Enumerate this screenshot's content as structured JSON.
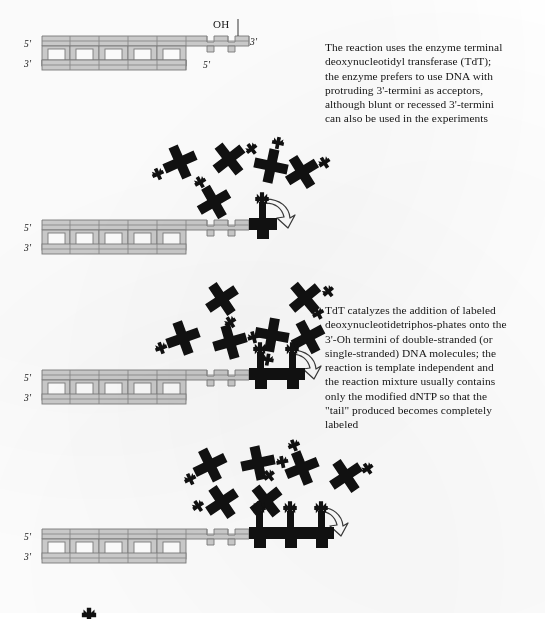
{
  "figure": {
    "background_color": "#ffffff",
    "duplex_color": "#cdcdcd",
    "duplex_outline_color": "#7c7c7c",
    "labeled_nucleotide_color": "#111111",
    "arrow_outline_color": "#3a3a3a"
  },
  "panels": [
    {
      "id": "panel-1",
      "step": 1,
      "description": "Double-stranded DNA with protruding 3'-terminus bearing a free OH group",
      "labels": {
        "top_left": "5'",
        "bottom_left": "3'",
        "top_right": "3'",
        "bottom_right": "5'",
        "hydroxyl": "OH"
      },
      "base_pairs": 5,
      "overhang_units": 3,
      "incorporated_nucleotides": 0,
      "free_nucleotides": 0,
      "has_arrow": false
    },
    {
      "id": "panel-2",
      "step": 2,
      "description": "Labeled dNTPs in solution; first modified nucleotide added to the 3'-OH terminus",
      "labels": {
        "top_left": "5'",
        "bottom_left": "3'"
      },
      "base_pairs": 5,
      "overhang_units": 3,
      "incorporated_nucleotides": 1,
      "free_nucleotides": 5,
      "has_arrow": true
    },
    {
      "id": "panel-3",
      "step": 3,
      "description": "Chain elongation continues; two labeled nucleotides now incorporated into the tail",
      "labels": {
        "top_left": "5'",
        "bottom_left": "3'"
      },
      "base_pairs": 5,
      "overhang_units": 3,
      "incorporated_nucleotides": 2,
      "free_nucleotides": 7,
      "has_arrow": true
    },
    {
      "id": "panel-4",
      "step": 4,
      "description": "Completely labeled tail with three incorporated modified nucleotides",
      "labels": {
        "top_left": "5'",
        "bottom_left": "3'"
      },
      "base_pairs": 5,
      "overhang_units": 3,
      "incorporated_nucleotides": 3,
      "free_nucleotides": 7,
      "has_arrow": true
    }
  ],
  "captions": [
    {
      "id": "caption-1",
      "text": "The reaction uses the enzyme terminal\ndeoxynucleotidyl transferase (TdT);\nthe enzyme prefers to use DNA with\nprotruding 3'-termini as acceptors,\nalthough blunt or recessed 3'-termini\ncan also be used in the experiments"
    },
    {
      "id": "caption-2",
      "text": "TdT catalyzes the addition of labeled\ndeoxynucleotidetriphos-phates onto the\n3'-Oh termini of double-stranded (or\nsingle-stranded) DNA molecules; the\nreaction is template independent and\nthe reaction mixture usually contains\nonly the modified dNTP so that the\n\"tail\" produced becomes completely\nlabeled"
    }
  ]
}
